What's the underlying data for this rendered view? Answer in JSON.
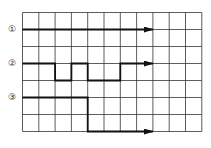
{
  "grid": {
    "x0": 22.5,
    "y0": 12.5,
    "cols": 11,
    "rows": 7,
    "cell_w": 16.3,
    "cell_h": 17,
    "line_color": "#333333",
    "bg": "#ffffff"
  },
  "trace_color": "#111111",
  "traces": [
    {
      "label": "①",
      "label_pos": [
        12,
        29
      ],
      "points": [
        [
          0,
          1
        ],
        [
          8,
          1
        ]
      ]
    },
    {
      "label": "②",
      "label_pos": [
        12,
        63
      ],
      "points": [
        [
          0,
          3
        ],
        [
          2,
          3
        ],
        [
          2,
          4
        ],
        [
          3,
          4
        ],
        [
          3,
          3
        ],
        [
          4,
          3
        ],
        [
          4,
          4
        ],
        [
          6,
          4
        ],
        [
          6,
          3
        ],
        [
          8,
          3
        ]
      ]
    },
    {
      "label": "③",
      "label_pos": [
        12,
        97
      ],
      "points": [
        [
          0,
          5
        ],
        [
          4,
          5
        ],
        [
          4,
          7
        ],
        [
          8,
          7
        ]
      ]
    }
  ]
}
